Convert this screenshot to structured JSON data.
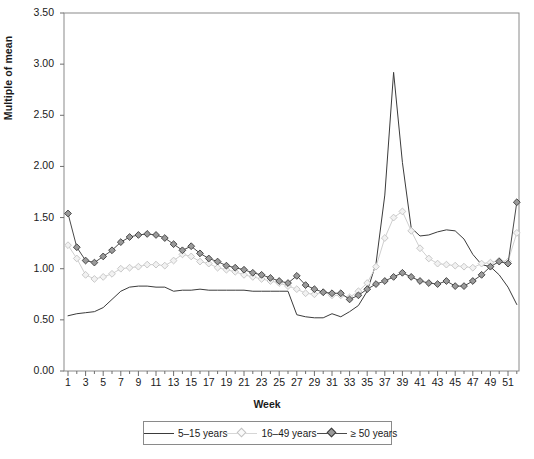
{
  "chart_data": {
    "type": "line",
    "title": "",
    "xlabel": "Week",
    "ylabel": "Multiple of mean",
    "xlim": [
      1,
      52
    ],
    "ylim": [
      0.0,
      3.5
    ],
    "ytick_labels": [
      "0.00",
      "0.50",
      "1.00",
      "1.50",
      "2.00",
      "2.50",
      "3.00",
      "3.50"
    ],
    "ytick_values": [
      0.0,
      0.5,
      1.0,
      1.5,
      2.0,
      2.5,
      3.0,
      3.5
    ],
    "xtick_labels": [
      "1",
      "3",
      "5",
      "7",
      "9",
      "11",
      "13",
      "15",
      "17",
      "19",
      "21",
      "23",
      "25",
      "27",
      "29",
      "31",
      "33",
      "35",
      "37",
      "39",
      "41",
      "43",
      "45",
      "47",
      "49",
      "51"
    ],
    "xtick_values": [
      1,
      3,
      5,
      7,
      9,
      11,
      13,
      15,
      17,
      19,
      21,
      23,
      25,
      27,
      29,
      31,
      33,
      35,
      37,
      39,
      41,
      43,
      45,
      47,
      49,
      51
    ],
    "grid": false,
    "legend_position": "bottom-center",
    "x": [
      1,
      2,
      3,
      4,
      5,
      6,
      7,
      8,
      9,
      10,
      11,
      12,
      13,
      14,
      15,
      16,
      17,
      18,
      19,
      20,
      21,
      22,
      23,
      24,
      25,
      26,
      27,
      28,
      29,
      30,
      31,
      32,
      33,
      34,
      35,
      36,
      37,
      38,
      39,
      40,
      41,
      42,
      43,
      44,
      45,
      46,
      47,
      48,
      49,
      50,
      51,
      52
    ],
    "series": [
      {
        "name": "5–15 years",
        "color": "#3b3b3b",
        "marker": "none",
        "values": [
          0.54,
          0.56,
          0.57,
          0.58,
          0.62,
          0.7,
          0.78,
          0.82,
          0.83,
          0.83,
          0.82,
          0.82,
          0.78,
          0.79,
          0.79,
          0.8,
          0.79,
          0.79,
          0.79,
          0.79,
          0.79,
          0.78,
          0.78,
          0.78,
          0.78,
          0.78,
          0.55,
          0.53,
          0.52,
          0.52,
          0.56,
          0.53,
          0.58,
          0.64,
          0.78,
          1.05,
          1.72,
          2.92,
          2.04,
          1.4,
          1.32,
          1.33,
          1.36,
          1.38,
          1.37,
          1.29,
          1.14,
          1.04,
          1.02,
          0.94,
          0.82,
          0.65
        ]
      },
      {
        "name": "16–49 years",
        "color": "#cfcfcf",
        "marker": "open-diamond",
        "values": [
          1.23,
          1.1,
          0.94,
          0.9,
          0.92,
          0.95,
          1.0,
          1.01,
          1.02,
          1.04,
          1.04,
          1.03,
          1.08,
          1.14,
          1.12,
          1.07,
          1.05,
          1.01,
          0.99,
          0.97,
          0.94,
          0.92,
          0.9,
          0.88,
          0.86,
          0.83,
          0.8,
          0.76,
          0.75,
          0.77,
          0.74,
          0.74,
          0.72,
          0.78,
          0.86,
          1.02,
          1.3,
          1.5,
          1.56,
          1.37,
          1.2,
          1.1,
          1.05,
          1.04,
          1.03,
          1.02,
          1.01,
          1.05,
          1.06,
          1.08,
          1.07,
          1.35
        ]
      },
      {
        "name": "≥ 50 years",
        "color": "#4a4a4a",
        "marker": "filled-diamond",
        "values": [
          1.54,
          1.21,
          1.08,
          1.06,
          1.12,
          1.18,
          1.26,
          1.31,
          1.33,
          1.34,
          1.33,
          1.3,
          1.24,
          1.18,
          1.22,
          1.15,
          1.1,
          1.07,
          1.03,
          1.01,
          0.99,
          0.96,
          0.94,
          0.91,
          0.88,
          0.86,
          0.93,
          0.84,
          0.8,
          0.77,
          0.76,
          0.76,
          0.7,
          0.74,
          0.8,
          0.85,
          0.88,
          0.92,
          0.96,
          0.92,
          0.88,
          0.86,
          0.85,
          0.88,
          0.83,
          0.83,
          0.88,
          0.94,
          1.02,
          1.07,
          1.05,
          1.65
        ]
      }
    ]
  },
  "legend": {
    "entries": [
      {
        "label": "5–15 years",
        "color": "#3b3b3b",
        "marker": "none"
      },
      {
        "label": "16–49 years",
        "color": "#cfcfcf",
        "marker": "open-diamond"
      },
      {
        "label": "≥ 50 years",
        "color": "#4a4a4a",
        "marker": "filled-diamond"
      }
    ]
  },
  "axes": {
    "ylabel": "Multiple of mean",
    "xlabel": "Week"
  },
  "colors": {
    "axis": "#6e6e6e",
    "frame": "#8a8a8a",
    "text": "#1a1a1a",
    "background": "#ffffff",
    "marker_fill_light": "#f2f2f2",
    "marker_fill_dark": "#9a9a9a"
  }
}
